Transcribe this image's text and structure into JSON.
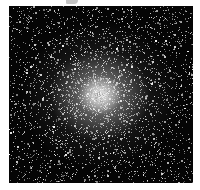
{
  "image": {
    "subject": "globular star cluster",
    "description": "Dense spherical cluster of stars on a black background, bright white core near center fading outward into scattered stars",
    "colors": {
      "background": "#050505",
      "core": "#ffffff",
      "stars": "#e6e6e6",
      "border": "#ffffff"
    },
    "core_center": [
      100,
      95
    ],
    "frame": {
      "x": 9,
      "y": 6,
      "width": 184,
      "height": 177
    }
  }
}
